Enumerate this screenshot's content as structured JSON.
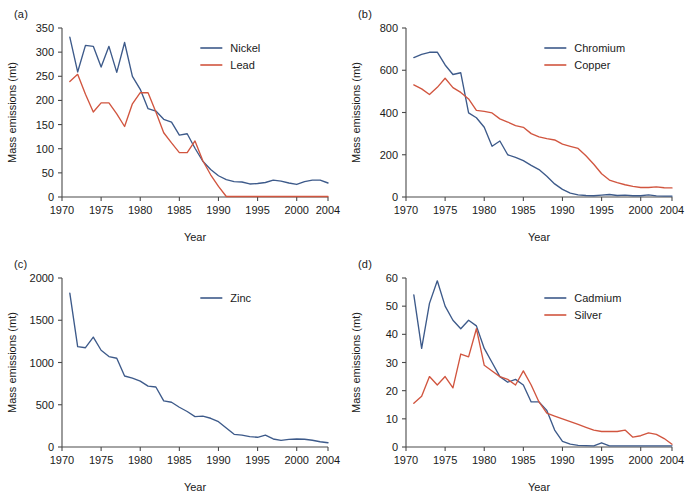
{
  "figure": {
    "panels": [
      {
        "tag": "(a)",
        "xlabel": "Year",
        "ylabel": "Mass emissions (mt)",
        "legend_position": "top-right",
        "chart_data": {
          "type": "line",
          "title": "",
          "xlabel": "Year",
          "ylabel": "Mass emissions (mt)",
          "xlim": [
            1970,
            2004
          ],
          "ylim": [
            0,
            350
          ],
          "xticks": [
            1970,
            1975,
            1980,
            1985,
            1990,
            1995,
            2000,
            2004
          ],
          "yticks": [
            0,
            50,
            100,
            150,
            200,
            250,
            300,
            350
          ],
          "grid": false,
          "legend": [
            "Nickel",
            "Lead"
          ],
          "x": [
            1971,
            1972,
            1973,
            1974,
            1975,
            1976,
            1977,
            1978,
            1979,
            1980,
            1981,
            1982,
            1983,
            1984,
            1985,
            1986,
            1987,
            1988,
            1989,
            1990,
            1991,
            1992,
            1993,
            1994,
            1995,
            1996,
            1997,
            1998,
            1999,
            2000,
            2001,
            2002,
            2003,
            2004
          ],
          "series": [
            {
              "name": "Nickel",
              "color": "#3d5a8a",
              "values": [
                331,
                259,
                314,
                312,
                269,
                312,
                258,
                320,
                250,
                223,
                183,
                178,
                161,
                155,
                128,
                131,
                101,
                74,
                57,
                44,
                36,
                32,
                31,
                27,
                28,
                30,
                35,
                33,
                29,
                26,
                32,
                35,
                35,
                29
              ]
            },
            {
              "name": "Lead",
              "color": "#d1553f",
              "values": [
                239,
                254,
                213,
                176,
                195,
                195,
                172,
                146,
                193,
                216,
                216,
                176,
                133,
                112,
                92,
                92,
                116,
                75,
                46,
                22,
                1,
                1,
                1,
                1,
                1,
                1,
                1,
                1,
                1,
                1,
                1,
                1,
                1,
                1
              ]
            }
          ]
        }
      },
      {
        "tag": "(b)",
        "xlabel": "Year",
        "ylabel": "Mass emissions (mt)",
        "legend_position": "top-right",
        "chart_data": {
          "type": "line",
          "title": "",
          "xlabel": "Year",
          "ylabel": "Mass emissions (mt)",
          "xlim": [
            1970,
            2004
          ],
          "ylim": [
            0,
            800
          ],
          "xticks": [
            1970,
            1975,
            1980,
            1985,
            1990,
            1995,
            2000,
            2004
          ],
          "yticks": [
            0,
            200,
            400,
            600,
            800
          ],
          "grid": false,
          "legend": [
            "Chromium",
            "Copper"
          ],
          "x": [
            1971,
            1972,
            1973,
            1974,
            1975,
            1976,
            1977,
            1978,
            1979,
            1980,
            1981,
            1982,
            1983,
            1984,
            1985,
            1986,
            1987,
            1988,
            1989,
            1990,
            1991,
            1992,
            1993,
            1994,
            1995,
            1996,
            1997,
            1998,
            1999,
            2000,
            2001,
            2002,
            2003,
            2004
          ],
          "series": [
            {
              "name": "Chromium",
              "color": "#3d5a8a",
              "values": [
                660,
                675,
                685,
                686,
                625,
                580,
                588,
                398,
                375,
                330,
                240,
                265,
                200,
                188,
                172,
                150,
                130,
                98,
                62,
                36,
                18,
                10,
                7,
                6,
                9,
                12,
                7,
                9,
                6,
                6,
                10,
                5,
                4,
                4
              ]
            },
            {
              "name": "Copper",
              "color": "#d1553f",
              "values": [
                531,
                512,
                485,
                519,
                562,
                518,
                495,
                464,
                410,
                405,
                398,
                370,
                355,
                338,
                330,
                300,
                285,
                276,
                270,
                250,
                240,
                230,
                195,
                155,
                110,
                80,
                68,
                58,
                50,
                45,
                45,
                48,
                44,
                43,
                78,
                52,
                36
              ]
            }
          ]
        }
      },
      {
        "tag": "(c)",
        "xlabel": "Year",
        "ylabel": "Mass emissions (mt)",
        "legend_position": "top-right",
        "chart_data": {
          "type": "line",
          "title": "",
          "xlabel": "Year",
          "ylabel": "Mass emissions (mt)",
          "xlim": [
            1970,
            2004
          ],
          "ylim": [
            0,
            2000
          ],
          "xticks": [
            1970,
            1975,
            1980,
            1985,
            1990,
            1995,
            2000,
            2004
          ],
          "yticks": [
            0,
            500,
            1000,
            1500,
            2000
          ],
          "grid": false,
          "legend": [
            "Zinc"
          ],
          "x": [
            1971,
            1972,
            1973,
            1974,
            1975,
            1976,
            1977,
            1978,
            1979,
            1980,
            1981,
            1982,
            1983,
            1984,
            1985,
            1986,
            1987,
            1988,
            1989,
            1990,
            1991,
            1992,
            1993,
            1994,
            1995,
            1996,
            1997,
            1998,
            1999,
            2000,
            2001,
            2002,
            2003,
            2004
          ],
          "series": [
            {
              "name": "Zinc",
              "color": "#3d5a8a",
              "values": [
                1820,
                1188,
                1175,
                1300,
                1145,
                1070,
                1050,
                840,
                815,
                780,
                720,
                710,
                545,
                530,
                470,
                420,
                360,
                365,
                340,
                300,
                225,
                150,
                140,
                122,
                115,
                140,
                95,
                78,
                90,
                95,
                92,
                80,
                62,
                50
              ]
            }
          ]
        }
      },
      {
        "tag": "(d)",
        "xlabel": "Year",
        "ylabel": "Mass emissions (mt)",
        "legend_position": "top-right",
        "chart_data": {
          "type": "line",
          "title": "",
          "xlabel": "Year",
          "ylabel": "Mass emissions (mt)",
          "xlim": [
            1970,
            2004
          ],
          "ylim": [
            0,
            60
          ],
          "xticks": [
            1970,
            1975,
            1980,
            1985,
            1990,
            1995,
            2000,
            2004
          ],
          "yticks": [
            0,
            10,
            20,
            30,
            40,
            50,
            60
          ],
          "grid": false,
          "legend": [
            "Cadmium",
            "Silver"
          ],
          "x": [
            1971,
            1972,
            1973,
            1974,
            1975,
            1976,
            1977,
            1978,
            1979,
            1980,
            1981,
            1982,
            1983,
            1984,
            1985,
            1986,
            1987,
            1988,
            1989,
            1990,
            1991,
            1992,
            1993,
            1994,
            1995,
            1996,
            1997,
            1998,
            1999,
            2000,
            2001,
            2002,
            2003,
            2004
          ],
          "series": [
            {
              "name": "Cadmium",
              "color": "#3d5a8a",
              "values": [
                54,
                35,
                51,
                59,
                50,
                45,
                42,
                45,
                43,
                35,
                30,
                25,
                23,
                24,
                22,
                16,
                16,
                13,
                6,
                2,
                1,
                0.6,
                0.5,
                0.4,
                1.5,
                0.4,
                0.4,
                0.4,
                0.4,
                0.4,
                0.4,
                0.4,
                0.4,
                0.4
              ]
            },
            {
              "name": "Silver",
              "color": "#d1553f",
              "values": [
                15.5,
                18,
                25,
                22,
                25,
                21,
                33,
                32,
                42,
                29,
                27,
                25,
                24,
                22,
                27,
                22,
                16,
                12,
                11,
                10,
                9,
                8,
                7,
                6,
                5.5,
                5.5,
                5.5,
                6,
                3.5,
                4,
                5,
                4.5,
                3,
                1
              ]
            }
          ]
        }
      }
    ]
  }
}
